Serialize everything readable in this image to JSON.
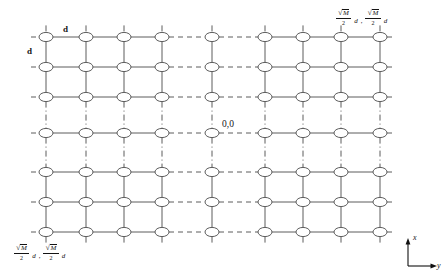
{
  "diagram": {
    "node_count_columns": 9,
    "node_count_rows": 7,
    "origin_label": "0,0",
    "spacing_label_horizontal": "d",
    "spacing_label_vertical": "d",
    "axis": {
      "vertical_label": "x",
      "horizontal_label": "y"
    },
    "corner_labels": {
      "top_right": {
        "first": {
          "radical_sign": "√",
          "radical_body": "M",
          "denominator": "2",
          "tail": "d"
        },
        "separator": ",",
        "second": {
          "radical_sign": "√",
          "radical_body": "M",
          "denominator": "2",
          "tail": "d"
        }
      },
      "bottom_left": {
        "first": {
          "radical_sign": "√",
          "radical_body": "M",
          "denominator": "2",
          "tail": "d"
        },
        "separator": ",",
        "second": {
          "radical_sign": "√",
          "radical_body": "M",
          "denominator": "2",
          "tail": "d"
        }
      }
    },
    "colors": {
      "line": "#4a4a4a",
      "node_fill": "#ffffff",
      "text": "#141414",
      "background": "#ffffff"
    },
    "geometry": {
      "columns_x": [
        46,
        86,
        124,
        162,
        212,
        265,
        303,
        341,
        380
      ],
      "rows_y": [
        37,
        67,
        97,
        133,
        172,
        202,
        232
      ],
      "gap_column_index": 4,
      "gap_row_index": 3,
      "node_rx": 7,
      "node_ry": 4.6
    }
  }
}
